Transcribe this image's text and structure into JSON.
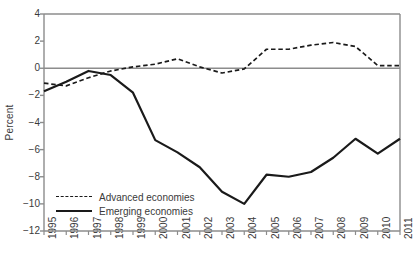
{
  "chart_data": {
    "type": "line",
    "title": "",
    "xlabel": "",
    "ylabel": "Percent",
    "x": [
      1995,
      1996,
      1997,
      1998,
      1999,
      2000,
      2001,
      2002,
      2003,
      2004,
      2005,
      2006,
      2007,
      2008,
      2009,
      2010,
      2011
    ],
    "categories": [
      "1995",
      "1996",
      "1997",
      "1998",
      "1999",
      "2000",
      "2001",
      "2002",
      "2003",
      "2004",
      "2005",
      "2006",
      "2007",
      "2008",
      "2009",
      "2010",
      "2011"
    ],
    "series": [
      {
        "name": "Advanced economies",
        "style": "dashed",
        "color": "#1a1a1a",
        "values": [
          -1.1,
          -1.3,
          -0.7,
          -0.2,
          0.1,
          0.3,
          0.7,
          0.1,
          -0.35,
          -0.05,
          1.4,
          1.4,
          1.7,
          1.9,
          1.6,
          0.2,
          0.2
        ]
      },
      {
        "name": "Emerging economies",
        "style": "solid",
        "color": "#1a1a1a",
        "values": [
          -1.7,
          -1.0,
          -0.2,
          -0.5,
          -1.8,
          -5.3,
          -6.2,
          -7.3,
          -9.1,
          -10.0,
          -7.85,
          -8.0,
          -7.65,
          -6.6,
          -5.2,
          -6.3,
          -5.2
        ]
      }
    ],
    "ylim": [
      -12,
      4
    ],
    "yticks": [
      4,
      2,
      0,
      -2,
      -4,
      -6,
      -8,
      -10,
      -12
    ],
    "ytick_labels": [
      "4",
      "2",
      "0",
      "−2",
      "−4",
      "−6",
      "−8",
      "−10",
      "−12"
    ],
    "xlim": [
      1995,
      2011
    ],
    "grid": false,
    "zero_line": true,
    "legend_position": "lower-left-inside",
    "axis_color": "#8c8c8c",
    "text_color": "#3a3a3a"
  },
  "legend": {
    "items": [
      {
        "label": "Advanced economies",
        "style": "dashed"
      },
      {
        "label": "Emerging economies",
        "style": "solid"
      }
    ]
  }
}
